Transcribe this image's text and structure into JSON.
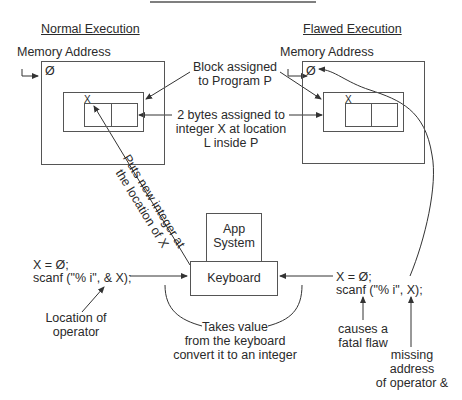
{
  "diagram": {
    "top_rule": true,
    "normal": {
      "heading": "Normal Execution",
      "memory_label": "Memory Address",
      "zero_symbol": "Ø",
      "cell_label": "X"
    },
    "flawed": {
      "heading": "Flawed Execution",
      "memory_label": "Memory Address",
      "zero_symbol": "Ø",
      "cell_label": "X"
    },
    "callouts": {
      "block_line1": "Block assigned",
      "block_line2": "to Program P",
      "bytes_line1": "2 bytes assigned to",
      "bytes_line2": "integer X at location",
      "bytes_line3": "L inside P",
      "puts_line1": "Puts new integer at",
      "puts_line2": "the location of X"
    },
    "devices": {
      "app_line1": "App",
      "app_line2": "System",
      "keyboard": "Keyboard"
    },
    "normal_code": {
      "line1": "X = Ø;",
      "line2": "scanf (\"% i\", & X);",
      "note_line1": "Location of",
      "note_line2": "operator"
    },
    "flawed_code": {
      "line1": "X = Ø;",
      "line2": "scanf (\"% i\", X);",
      "note1_line1": "causes a",
      "note1_line2": "fatal flaw",
      "note2_line1": "missing",
      "note2_line2": "address",
      "note2_line3": "of operator &"
    },
    "keyboard_note": {
      "line1": "Takes value",
      "line2": "from the keyboard",
      "line3": "convert it to an integer"
    },
    "colors": {
      "line": "#444444",
      "text": "#2a2a2a",
      "background": "#ffffff"
    }
  }
}
